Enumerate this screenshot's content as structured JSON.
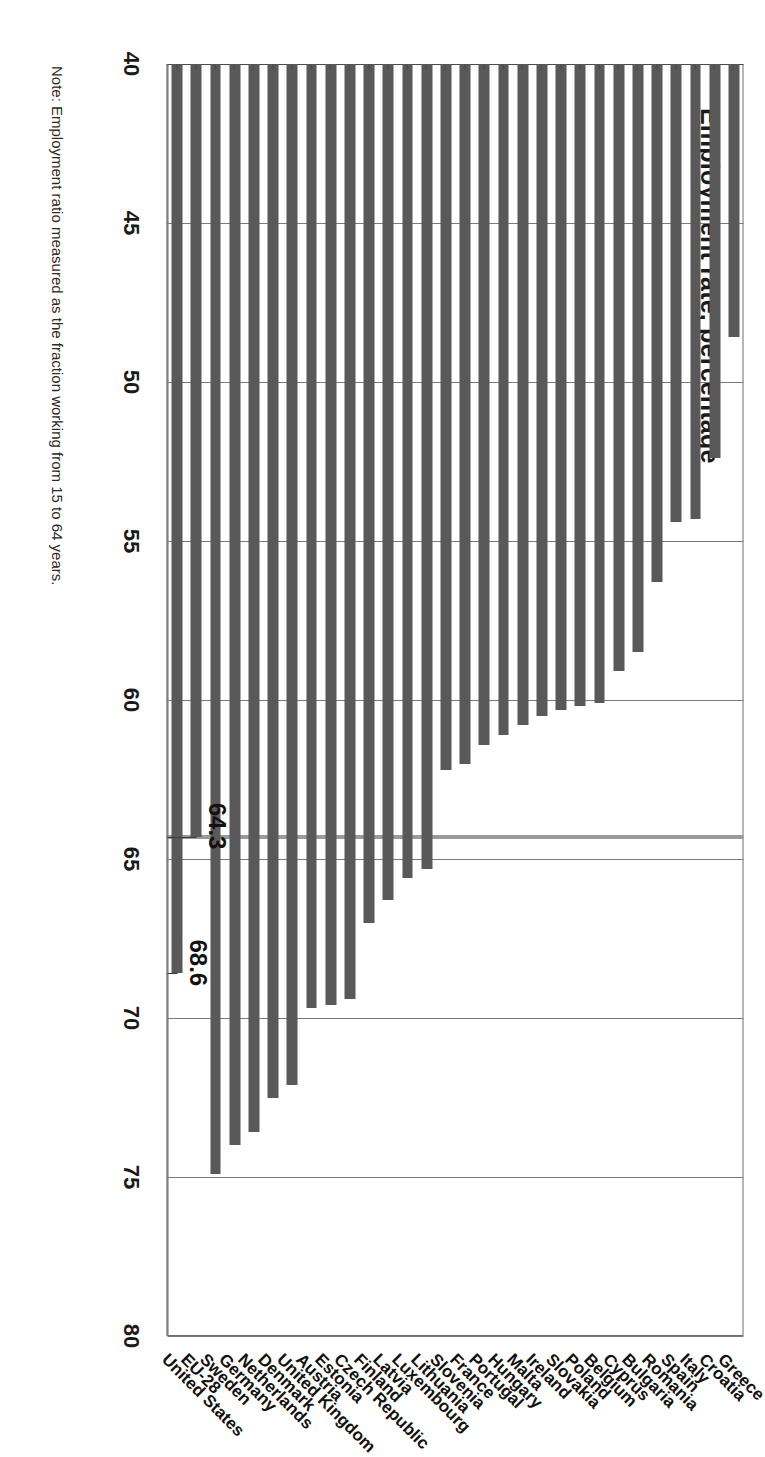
{
  "chart_data": {
    "type": "bar",
    "orientation": "horizontal",
    "title": "Employment rate, percentage",
    "xlabel": "",
    "ylabel": "",
    "ylim": [
      40,
      80
    ],
    "yticks": [
      40,
      45,
      50,
      55,
      60,
      65,
      70,
      75,
      80
    ],
    "grid": true,
    "legend": "none",
    "bar_color": "#595959",
    "reference_line_color": "#9a9a9a",
    "reference_value": 64.3,
    "categories": [
      "Greece",
      "Croatia",
      "Italy",
      "Spain",
      "Romania",
      "Bulgaria",
      "Cyprus",
      "Belgium",
      "Poland",
      "Slovakia",
      "Ireland",
      "Malta",
      "Hungary",
      "Portugal",
      "France",
      "Slovenia",
      "Lithuania",
      "Luxembourg",
      "Latvia",
      "Finland",
      "Czech Republic",
      "Estonia",
      "Austria",
      "United Kingdom",
      "Denmark",
      "Netherlands",
      "Germany",
      "Sweden",
      "EU-28",
      "United States"
    ],
    "values": [
      48.6,
      52.4,
      54.3,
      54.4,
      56.3,
      58.5,
      59.1,
      60.1,
      60.2,
      60.3,
      60.5,
      60.8,
      61.1,
      61.4,
      62.0,
      62.2,
      65.3,
      65.6,
      66.3,
      67.0,
      69.4,
      69.6,
      69.7,
      72.1,
      72.5,
      73.6,
      74.0,
      74.9,
      64.3,
      68.6
    ],
    "annotations": [
      {
        "label": "68.6",
        "category": "United States",
        "value": 68.6
      },
      {
        "label": "64.3",
        "category": "EU-28",
        "value": 64.3
      }
    ]
  },
  "axis": {
    "tick_labels": [
      "40",
      "45",
      "50",
      "55",
      "60",
      "65",
      "70",
      "75",
      "80"
    ]
  },
  "footnote": {
    "text": "Note: Employment ratio measured as the fraction working from 15 to 64 years."
  },
  "colors": {
    "bar": "#595959",
    "grid": "#7a7a7a",
    "axis": "#4a4a4a",
    "reference": "#9a9a9a",
    "text": "#111111",
    "background": "#ffffff"
  }
}
